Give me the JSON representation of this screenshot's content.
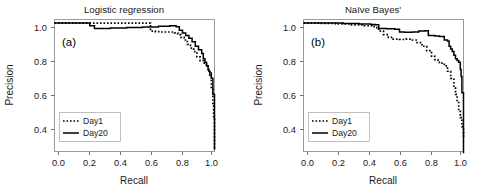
{
  "figure": {
    "background": "#ffffff",
    "accent": "#000000"
  },
  "panels": [
    {
      "id": "panel-a",
      "title": "Logistic regression",
      "tag": "(a)",
      "xlabel": "Recall",
      "ylabel": "Precision"
    },
    {
      "id": "panel-b",
      "title": "Naïve Bayes'",
      "tag": "(b)",
      "xlabel": "Recall",
      "ylabel": "Precision"
    }
  ],
  "axis": {
    "xticks": [
      "0.0",
      "0.2",
      "0.4",
      "0.6",
      "0.8",
      "1.0"
    ],
    "yticks": [
      "0.4",
      "0.6",
      "0.8",
      "1.0"
    ]
  },
  "legend": {
    "day1_label": "Day1",
    "day20_label": "Day20",
    "day1_style": "dotted",
    "day20_style": "solid",
    "color": "#000000"
  },
  "chart_data": [
    {
      "type": "line",
      "title": "Logistic regression",
      "tag": "(a)",
      "xlabel": "Recall",
      "ylabel": "Precision",
      "xlim": [
        0.0,
        1.0
      ],
      "ylim": [
        0.28,
        1.02
      ],
      "xticks": [
        0.0,
        0.2,
        0.4,
        0.6,
        0.8,
        1.0
      ],
      "yticks": [
        0.4,
        0.6,
        0.8,
        1.0
      ],
      "grid": false,
      "legend_position": "lower-left",
      "series": [
        {
          "name": "Day1",
          "style": "dotted",
          "x": [
            0.0,
            0.1,
            0.2,
            0.3,
            0.4,
            0.5,
            0.57,
            0.6,
            0.63,
            0.66,
            0.7,
            0.73,
            0.75,
            0.77,
            0.79,
            0.81,
            0.83,
            0.85,
            0.87,
            0.89,
            0.91,
            0.93,
            0.94,
            0.95,
            0.96,
            0.97,
            0.98,
            0.99,
            0.995,
            1.0
          ],
          "y": [
            1.0,
            1.0,
            1.0,
            1.0,
            1.0,
            1.0,
            1.0,
            0.955,
            0.952,
            0.95,
            0.95,
            0.95,
            0.945,
            0.935,
            0.92,
            0.905,
            0.88,
            0.86,
            0.84,
            0.81,
            0.79,
            0.775,
            0.77,
            0.76,
            0.74,
            0.7,
            0.64,
            0.55,
            0.47,
            0.29
          ]
        },
        {
          "name": "Day20",
          "style": "solid",
          "x": [
            0.0,
            0.1,
            0.2,
            0.22,
            0.25,
            0.35,
            0.45,
            0.55,
            0.65,
            0.72,
            0.76,
            0.78,
            0.8,
            0.82,
            0.84,
            0.86,
            0.88,
            0.9,
            0.92,
            0.93,
            0.94,
            0.95,
            0.96,
            0.965,
            0.97,
            0.98,
            0.99,
            1.0
          ],
          "y": [
            1.0,
            1.0,
            1.0,
            0.985,
            0.97,
            0.972,
            0.975,
            0.978,
            0.982,
            0.985,
            0.98,
            0.96,
            0.945,
            0.93,
            0.915,
            0.895,
            0.87,
            0.85,
            0.83,
            0.8,
            0.78,
            0.76,
            0.74,
            0.73,
            0.72,
            0.69,
            0.6,
            0.29
          ]
        }
      ]
    },
    {
      "type": "line",
      "title": "Naïve Bayes'",
      "tag": "(b)",
      "xlabel": "Recall",
      "ylabel": "Precision",
      "xlim": [
        0.0,
        1.0
      ],
      "ylim": [
        0.28,
        1.02
      ],
      "xticks": [
        0.0,
        0.2,
        0.4,
        0.6,
        0.8,
        1.0
      ],
      "yticks": [
        0.4,
        0.6,
        0.8,
        1.0
      ],
      "grid": false,
      "legend_position": "lower-left",
      "series": [
        {
          "name": "Day1",
          "style": "dotted",
          "x": [
            0.0,
            0.1,
            0.2,
            0.3,
            0.38,
            0.43,
            0.45,
            0.47,
            0.5,
            0.53,
            0.56,
            0.6,
            0.64,
            0.68,
            0.71,
            0.74,
            0.77,
            0.8,
            0.82,
            0.84,
            0.86,
            0.88,
            0.9,
            0.92,
            0.94,
            0.95,
            0.96,
            0.97,
            0.98,
            0.99,
            1.0
          ],
          "y": [
            1.0,
            0.998,
            0.995,
            0.99,
            0.985,
            0.98,
            0.975,
            0.955,
            0.935,
            0.92,
            0.91,
            0.908,
            0.91,
            0.905,
            0.89,
            0.87,
            0.845,
            0.815,
            0.795,
            0.78,
            0.775,
            0.76,
            0.73,
            0.69,
            0.64,
            0.6,
            0.56,
            0.51,
            0.47,
            0.42,
            0.355
          ]
        },
        {
          "name": "Day20",
          "style": "solid",
          "x": [
            0.0,
            0.12,
            0.25,
            0.35,
            0.42,
            0.45,
            0.47,
            0.52,
            0.57,
            0.6,
            0.63,
            0.68,
            0.72,
            0.76,
            0.78,
            0.82,
            0.85,
            0.88,
            0.9,
            0.91,
            0.92,
            0.93,
            0.94,
            0.95,
            0.96,
            0.97,
            0.98,
            0.985,
            0.99,
            1.0
          ],
          "y": [
            1.0,
            1.0,
            0.998,
            0.995,
            0.992,
            0.99,
            0.97,
            0.968,
            0.965,
            0.95,
            0.948,
            0.95,
            0.955,
            0.957,
            0.93,
            0.928,
            0.925,
            0.905,
            0.9,
            0.87,
            0.855,
            0.84,
            0.82,
            0.8,
            0.79,
            0.78,
            0.74,
            0.7,
            0.61,
            0.27
          ]
        }
      ]
    }
  ]
}
